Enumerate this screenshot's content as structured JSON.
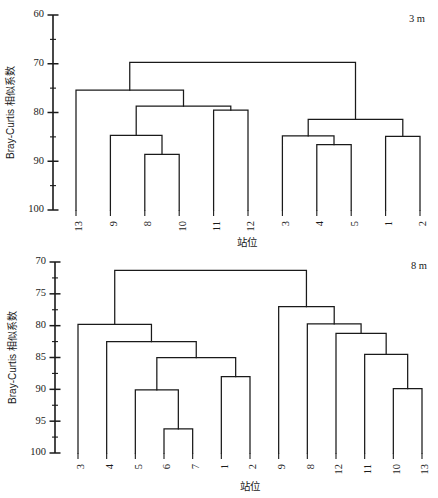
{
  "figure": {
    "type": "dendrogram-pair",
    "background_color": "#ffffff",
    "line_color": "#1a1a1a"
  },
  "chart_data": [
    {
      "type": "dendrogram",
      "panel_id": "top",
      "title": "3 m",
      "xlabel": "站位",
      "ylabel": "Bray-Curtis 相似系数",
      "y_axis_inverted": true,
      "ylim": [
        60,
        100
      ],
      "yticks": [
        60,
        70,
        80,
        90,
        100
      ],
      "ytick_labels": [
        "60",
        "70",
        "80",
        "90",
        "100"
      ],
      "grid": false,
      "legend": "none",
      "leaf_labels": [
        "13",
        "9",
        "8",
        "10",
        "11",
        "12",
        "3",
        "4",
        "5",
        "1",
        "2"
      ],
      "leaf_baseline": 100,
      "merges": [
        {
          "id": "m1",
          "left": "8",
          "right": "10",
          "height": 88.6
        },
        {
          "id": "m2",
          "left": "9",
          "right": "m1",
          "height": 84.7
        },
        {
          "id": "m3",
          "left": "11",
          "right": "12",
          "height": 79.5
        },
        {
          "id": "m4",
          "left": "m2",
          "right": "m3",
          "height": 78.7
        },
        {
          "id": "m5",
          "left": "13",
          "right": "m4",
          "height": 75.4
        },
        {
          "id": "m6",
          "left": "4",
          "right": "5",
          "height": 86.6
        },
        {
          "id": "m7",
          "left": "3",
          "right": "m6",
          "height": 84.8
        },
        {
          "id": "m8",
          "left": "1",
          "right": "2",
          "height": 84.9
        },
        {
          "id": "m9",
          "left": "m7",
          "right": "m8",
          "height": 81.4
        },
        {
          "id": "m10",
          "left": "m5",
          "right": "m9",
          "height": 69.7
        }
      ]
    },
    {
      "type": "dendrogram",
      "panel_id": "bottom",
      "title": "8 m",
      "xlabel": "站位",
      "ylabel": "Bray-Curtis 相似系数",
      "y_axis_inverted": true,
      "ylim": [
        70,
        100
      ],
      "yticks": [
        70,
        75,
        80,
        85,
        90,
        95,
        100
      ],
      "ytick_labels": [
        "70",
        "75",
        "80",
        "85",
        "90",
        "95",
        "100"
      ],
      "grid": false,
      "legend": "none",
      "leaf_labels": [
        "3",
        "4",
        "5",
        "6",
        "7",
        "1",
        "2",
        "9",
        "8",
        "12",
        "11",
        "10",
        "13"
      ],
      "leaf_baseline": 100,
      "merges": [
        {
          "id": "n1",
          "left": "6",
          "right": "7",
          "height": 96.2
        },
        {
          "id": "n2",
          "left": "5",
          "right": "n1",
          "height": 90.1
        },
        {
          "id": "n3",
          "left": "1",
          "right": "2",
          "height": 88.0
        },
        {
          "id": "n4",
          "left": "n2",
          "right": "n3",
          "height": 85.0
        },
        {
          "id": "n5",
          "left": "4",
          "right": "n4",
          "height": 82.5
        },
        {
          "id": "n6",
          "left": "3",
          "right": "n5",
          "height": 79.8
        },
        {
          "id": "n7",
          "left": "10",
          "right": "13",
          "height": 89.9
        },
        {
          "id": "n8",
          "left": "11",
          "right": "n7",
          "height": 84.5
        },
        {
          "id": "n9",
          "left": "12",
          "right": "n8",
          "height": 81.2
        },
        {
          "id": "n10",
          "left": "8",
          "right": "n9",
          "height": 79.7
        },
        {
          "id": "n11",
          "left": "9",
          "right": "n10",
          "height": 77.0
        },
        {
          "id": "n12",
          "left": "n6",
          "right": "n11",
          "height": 71.3
        }
      ]
    }
  ]
}
